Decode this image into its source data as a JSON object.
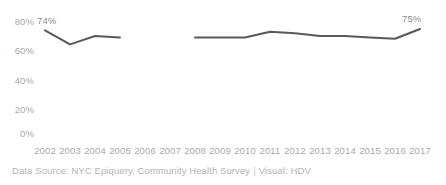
{
  "chart_data": {
    "type": "line",
    "title": "",
    "subtitle": "",
    "xlabel": "",
    "ylabel": "",
    "categories": [
      "2002",
      "2003",
      "2004",
      "2005",
      "2006",
      "2007",
      "2008",
      "2009",
      "2010",
      "2011",
      "2012",
      "2013",
      "2014",
      "2015",
      "2016",
      "2017"
    ],
    "series": [
      {
        "name": "Percent",
        "values": [
          74,
          64,
          70,
          69,
          null,
          null,
          69,
          69,
          69,
          73,
          72,
          70,
          70,
          69,
          68,
          75
        ]
      }
    ],
    "ylim": [
      0,
      80
    ],
    "ytick_labels": [
      "80%",
      "60%",
      "40%",
      "20%",
      "0%"
    ],
    "ytick_values": [
      80,
      60,
      40,
      20,
      0
    ],
    "xtick_labels": [
      "2002",
      "2003",
      "2004",
      "2005",
      "2006",
      "2007",
      "2008",
      "2009",
      "2010",
      "2011",
      "2012",
      "2013",
      "2014",
      "2015",
      "2016",
      "2017"
    ],
    "grid": false,
    "legend": false,
    "legend_position": "none",
    "line_color": "#59595b",
    "line_width": 2,
    "gap_note": "no data plotted for 2006 and 2007",
    "point_labels": [
      {
        "name": "start-label",
        "category": "2002",
        "value": 74,
        "text": "74%"
      },
      {
        "name": "end-label",
        "category": "2017",
        "value": 75,
        "text": "75%"
      }
    ]
  },
  "axis": {
    "y_ticks": [
      {
        "label": "80%"
      },
      {
        "label": "60%"
      },
      {
        "label": "40%"
      },
      {
        "label": "20%"
      },
      {
        "label": "0%"
      }
    ],
    "x_ticks": [
      {
        "label": "2002"
      },
      {
        "label": "2003"
      },
      {
        "label": "2004"
      },
      {
        "label": "2005"
      },
      {
        "label": "2006"
      },
      {
        "label": "2007"
      },
      {
        "label": "2008"
      },
      {
        "label": "2009"
      },
      {
        "label": "2010"
      },
      {
        "label": "2011"
      },
      {
        "label": "2012"
      },
      {
        "label": "2013"
      },
      {
        "label": "2014"
      },
      {
        "label": "2015"
      },
      {
        "label": "2016"
      },
      {
        "label": "2017"
      }
    ]
  },
  "labels": {
    "start": "74%",
    "end": "75%"
  },
  "footer": {
    "source": "Data Source: NYC Epiquery, Community Health Survey",
    "separator": "|",
    "visual": "Visual: HDV"
  },
  "colors": {
    "line": "#59595b",
    "axis_text": "#a9a9ab",
    "label_text": "#8d8d90",
    "footer_text": "#b3b3b5",
    "background": "#ffffff"
  }
}
